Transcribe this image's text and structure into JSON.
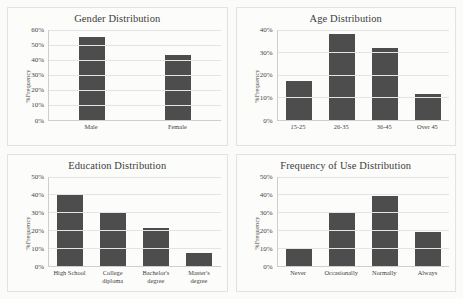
{
  "page": {
    "background_color": "#fbfbfa",
    "bar_color": "#4d4d4d",
    "grid_color": "#e4e4e4",
    "axis_color": "#cfcfcf"
  },
  "chart_data": [
    {
      "id": "gender",
      "type": "bar",
      "title": "Gender Distribution",
      "xlabel": "",
      "ylabel": "%Frequency",
      "categories": [
        "Male",
        "Female"
      ],
      "values": [
        55,
        43
      ],
      "ylim": [
        0,
        60
      ],
      "yticks": [
        0,
        10,
        20,
        30,
        40,
        50,
        60
      ],
      "ytick_labels": [
        "0%",
        "10%",
        "20%",
        "30%",
        "40%",
        "50%",
        "60%"
      ],
      "grid": true,
      "legend": "none"
    },
    {
      "id": "age",
      "type": "bar",
      "title": "Age Distribution",
      "xlabel": "",
      "ylabel": "%Frequency",
      "categories": [
        "15-25",
        "26-35",
        "36-45",
        "Over 45"
      ],
      "values": [
        17,
        38,
        32,
        11.5
      ],
      "ylim": [
        0,
        40
      ],
      "yticks": [
        0,
        10,
        20,
        30,
        40
      ],
      "ytick_labels": [
        "0%",
        "10%",
        "20%",
        "30%",
        "40%"
      ],
      "grid": true,
      "legend": "none"
    },
    {
      "id": "education",
      "type": "bar",
      "title": "Education Distribution",
      "xlabel": "",
      "ylabel": "%Frequency",
      "categories": [
        "High School",
        "College\ndiploma",
        "Bachelor's\ndegree",
        "Master's\ndegree"
      ],
      "values": [
        40,
        30,
        21,
        7.5
      ],
      "ylim": [
        0,
        50
      ],
      "yticks": [
        0,
        10,
        20,
        30,
        40,
        50
      ],
      "ytick_labels": [
        "0%",
        "10%",
        "20%",
        "30%",
        "40%",
        "50%"
      ],
      "grid": true,
      "legend": "none"
    },
    {
      "id": "frequency",
      "type": "bar",
      "title": "Frequency of Use Distribution",
      "xlabel": "",
      "ylabel": "%Frequency",
      "categories": [
        "Never",
        "Occasionally",
        "Normally",
        "Always"
      ],
      "values": [
        10,
        30,
        39,
        19
      ],
      "ylim": [
        0,
        50
      ],
      "yticks": [
        0,
        10,
        20,
        30,
        40,
        50
      ],
      "ytick_labels": [
        "0%",
        "10%",
        "20%",
        "30%",
        "40%",
        "50%"
      ],
      "grid": true,
      "legend": "none"
    }
  ]
}
